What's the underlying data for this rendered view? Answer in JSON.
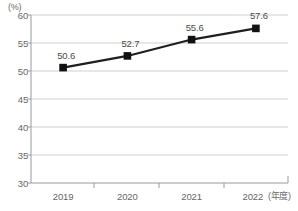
{
  "chart_data": {
    "type": "line",
    "title": "",
    "subtitle": "",
    "xlabel": "(年度)",
    "ylabel": "(%)",
    "categories": [
      "2019",
      "2020",
      "2021",
      "2022"
    ],
    "values": [
      50.6,
      52.7,
      55.6,
      57.6
    ],
    "data_labels": [
      "50.6",
      "52.7",
      "55.6",
      "57.6"
    ],
    "series": [
      {
        "name": "",
        "values": [
          50.6,
          52.7,
          55.6,
          57.6
        ]
      }
    ],
    "ylim": [
      30,
      60
    ],
    "y_ticks": [
      60,
      55,
      50,
      45,
      40,
      35,
      30
    ],
    "y_tick_labels": [
      "60",
      "55",
      "50",
      "45",
      "40",
      "35",
      "30"
    ],
    "grid": true,
    "legend": "none",
    "marker": "square",
    "colors": {
      "line": "#1f1f1f",
      "marker": "#111111",
      "grid": "#c9c9c9",
      "axis": "#9a9a9a",
      "text": "#666666",
      "background": "#ffffff"
    }
  }
}
